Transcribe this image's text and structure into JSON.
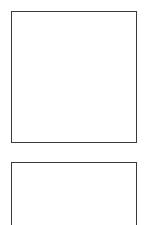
{
  "page": {
    "background_color": "#ffffff",
    "width": 147,
    "height": 225,
    "content_text": ""
  },
  "frames": [
    {
      "name": "upper-frame",
      "label": "",
      "content_text": "",
      "fill_color": "#ffffff",
      "border_color": "#3a3a3a",
      "border_width_px": 1,
      "x": 11,
      "y": 11,
      "width": 126,
      "height": 132,
      "clipped": false
    },
    {
      "name": "lower-frame",
      "label": "",
      "content_text": "",
      "fill_color": "#ffffff",
      "border_color": "#3a3a3a",
      "border_width_px": 1,
      "x": 11,
      "y": 162,
      "width": 126,
      "height": 80,
      "clipped": true
    }
  ]
}
